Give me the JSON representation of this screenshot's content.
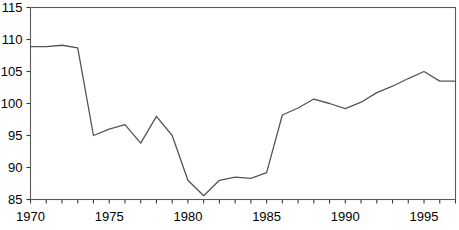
{
  "chart_data": {
    "type": "line",
    "title": "",
    "xlabel": "",
    "ylabel": "",
    "xlim": [
      1970,
      1997
    ],
    "ylim": [
      85,
      115
    ],
    "grid": false,
    "legend": null,
    "x": [
      1970,
      1971,
      1972,
      1973,
      1974,
      1975,
      1976,
      1977,
      1978,
      1979,
      1980,
      1981,
      1982,
      1983,
      1984,
      1985,
      1986,
      1987,
      1988,
      1989,
      1990,
      1991,
      1992,
      1993,
      1994,
      1995,
      1996,
      1997
    ],
    "values": [
      108.9,
      108.9,
      109.1,
      108.7,
      95.0,
      96.0,
      96.7,
      93.8,
      98.0,
      95.0,
      88.0,
      85.6,
      88.0,
      88.5,
      88.3,
      89.2,
      98.2,
      99.3,
      100.7,
      100.0,
      99.2,
      100.2,
      101.7,
      102.7,
      103.9,
      105.0,
      103.5,
      103.5
    ],
    "series": [
      {
        "name": "series-1",
        "color": "#555555",
        "values": [
          108.9,
          108.9,
          109.1,
          108.7,
          95.0,
          96.0,
          96.7,
          93.8,
          98.0,
          95.0,
          88.0,
          85.6,
          88.0,
          88.5,
          88.3,
          89.2,
          98.2,
          99.3,
          100.7,
          100.0,
          99.2,
          100.2,
          101.7,
          102.7,
          103.9,
          105.0,
          103.5,
          103.5
        ]
      }
    ],
    "y_ticks": [
      85,
      90,
      95,
      100,
      105,
      110,
      115
    ],
    "y_tick_labels": [
      "85",
      "90",
      "95",
      "100",
      "105",
      "110",
      "115"
    ],
    "x_ticks": [
      1970,
      1971,
      1972,
      1973,
      1974,
      1975,
      1976,
      1977,
      1978,
      1979,
      1980,
      1981,
      1982,
      1983,
      1984,
      1985,
      1986,
      1987,
      1988,
      1989,
      1990,
      1991,
      1992,
      1993,
      1994,
      1995,
      1996,
      1997
    ],
    "x_tick_labels_shown": [
      {
        "value": 1970,
        "label": "1970"
      },
      {
        "value": 1975,
        "label": "1975"
      },
      {
        "value": 1980,
        "label": "1980"
      },
      {
        "value": 1985,
        "label": "1985"
      },
      {
        "value": 1990,
        "label": "1990"
      },
      {
        "value": 1995,
        "label": "1995"
      }
    ],
    "colors": {
      "line": "#555555",
      "axis": "#3a3a3a",
      "frame": "#5a5a5a",
      "background": "#ffffff",
      "text": "#000000"
    }
  }
}
